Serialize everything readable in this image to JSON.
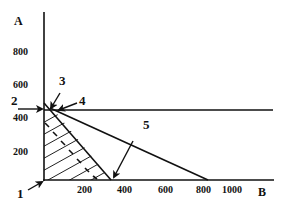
{
  "figure": {
    "axes": {
      "y_label": "A",
      "x_label": "B",
      "y_ticks": [
        "800",
        "600",
        "400",
        "200"
      ],
      "x_ticks": [
        "200",
        "400",
        "600",
        "800",
        "1000"
      ]
    },
    "callouts": [
      {
        "id": "1",
        "label": "1",
        "target": "origin"
      },
      {
        "id": "2",
        "label": "2",
        "target": "horizontal-constraint-intercept"
      },
      {
        "id": "3",
        "label": "3",
        "target": "steep-constraint-line-top"
      },
      {
        "id": "4",
        "label": "4",
        "target": "vertex-intersection"
      },
      {
        "id": "5",
        "label": "5",
        "target": "steep-constraint-x-intercept"
      }
    ],
    "lines": [
      {
        "name": "horizontal-constraint",
        "A": 450,
        "B_range": [
          0,
          1100
        ]
      },
      {
        "name": "steep-constraint",
        "from": {
          "B": 0,
          "A": 470
        },
        "to": {
          "B": 330,
          "A": 0
        }
      },
      {
        "name": "shallow-constraint",
        "from": {
          "B": 30,
          "A": 450
        },
        "to": {
          "B": 800,
          "A": 0
        }
      }
    ],
    "feasible_region": "hatched triangle bounded by A-axis, B-axis and steep constraint"
  }
}
